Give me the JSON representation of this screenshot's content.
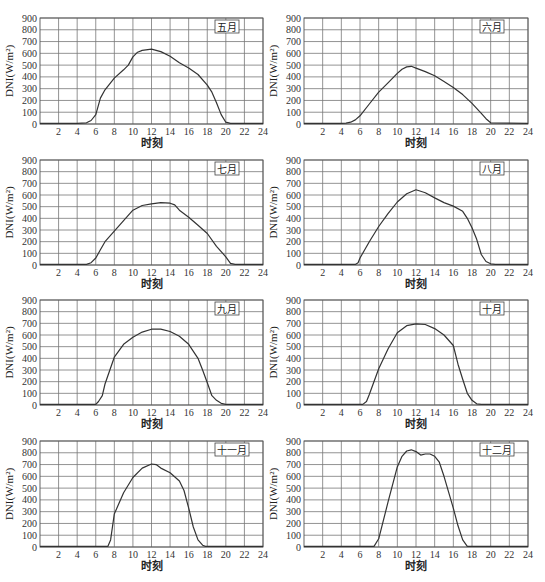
{
  "chart_data": [
    {
      "type": "line",
      "title": "五月",
      "xlabel": "时刻",
      "ylabel": "DNI(W/m²)",
      "xlim": [
        0,
        24
      ],
      "ylim": [
        0,
        900
      ],
      "xticks": [
        2,
        4,
        6,
        8,
        10,
        12,
        14,
        16,
        18,
        20,
        22,
        24
      ],
      "yticks": [
        0,
        100,
        200,
        300,
        400,
        500,
        600,
        700,
        800,
        900
      ],
      "grid": true,
      "x": [
        0,
        4,
        5,
        5.5,
        6,
        6.5,
        7,
        8,
        9,
        9.5,
        10,
        10.5,
        11,
        12,
        13,
        14,
        15,
        16,
        17,
        18,
        18.5,
        19,
        19.5,
        20,
        20.5,
        24
      ],
      "values": [
        5,
        5,
        10,
        30,
        80,
        220,
        290,
        390,
        460,
        500,
        570,
        610,
        625,
        635,
        615,
        575,
        520,
        475,
        420,
        330,
        270,
        180,
        80,
        15,
        5,
        5
      ]
    },
    {
      "type": "line",
      "title": "六月",
      "xlabel": "时刻",
      "ylabel": "DNI(W/m²)",
      "xlim": [
        0,
        24
      ],
      "ylim": [
        0,
        900
      ],
      "xticks": [
        2,
        4,
        6,
        8,
        10,
        12,
        14,
        16,
        18,
        20,
        22,
        24
      ],
      "yticks": [
        0,
        100,
        200,
        300,
        400,
        500,
        600,
        700,
        800,
        900
      ],
      "grid": true,
      "x": [
        0,
        4,
        4.5,
        5,
        5.5,
        6,
        7,
        8,
        9,
        10,
        10.5,
        11,
        11.5,
        12,
        13,
        14,
        15,
        16,
        17,
        18,
        19,
        19.5,
        20,
        24
      ],
      "values": [
        5,
        5,
        8,
        15,
        35,
        70,
        170,
        270,
        350,
        430,
        465,
        485,
        490,
        475,
        445,
        410,
        360,
        310,
        250,
        175,
        90,
        45,
        10,
        5
      ]
    },
    {
      "type": "line",
      "title": "七月",
      "xlabel": "时刻",
      "ylabel": "DNI(W/m²)",
      "xlim": [
        0,
        24
      ],
      "ylim": [
        0,
        900
      ],
      "xticks": [
        2,
        4,
        6,
        8,
        10,
        12,
        14,
        16,
        18,
        20,
        22,
        24
      ],
      "yticks": [
        0,
        100,
        200,
        300,
        400,
        500,
        600,
        700,
        800,
        900
      ],
      "grid": true,
      "x": [
        0,
        5,
        5.5,
        6,
        6.5,
        7,
        8,
        9,
        10,
        11,
        12,
        13,
        14,
        14.5,
        15,
        16,
        17,
        18,
        19,
        20,
        20.5,
        21,
        24
      ],
      "values": [
        5,
        5,
        20,
        60,
        130,
        200,
        290,
        380,
        470,
        510,
        525,
        535,
        530,
        515,
        470,
        410,
        340,
        270,
        160,
        70,
        15,
        5,
        5
      ]
    },
    {
      "type": "line",
      "title": "八月",
      "xlabel": "时刻",
      "ylabel": "DNI(W/m²)",
      "xlim": [
        0,
        24
      ],
      "ylim": [
        0,
        900
      ],
      "xticks": [
        2,
        4,
        6,
        8,
        10,
        12,
        14,
        16,
        18,
        20,
        22,
        24
      ],
      "yticks": [
        0,
        100,
        200,
        300,
        400,
        500,
        600,
        700,
        800,
        900
      ],
      "grid": true,
      "x": [
        0,
        5.5,
        5.8,
        6,
        7,
        8,
        9,
        10,
        11,
        12,
        13,
        14,
        15,
        16,
        17,
        17.5,
        18,
        18.5,
        19,
        19.5,
        20,
        20.5,
        24
      ],
      "values": [
        5,
        5,
        20,
        60,
        200,
        330,
        440,
        540,
        610,
        645,
        620,
        575,
        535,
        505,
        460,
        400,
        320,
        220,
        90,
        30,
        10,
        5,
        5
      ]
    },
    {
      "type": "line",
      "title": "九月",
      "xlabel": "时刻",
      "ylabel": "DNI(W/m²)",
      "xlim": [
        0,
        24
      ],
      "ylim": [
        0,
        900
      ],
      "xticks": [
        2,
        4,
        6,
        8,
        10,
        12,
        14,
        16,
        18,
        20,
        22,
        24
      ],
      "yticks": [
        0,
        100,
        200,
        300,
        400,
        500,
        600,
        700,
        800,
        900
      ],
      "grid": true,
      "x": [
        0,
        6,
        6.3,
        6.7,
        7,
        8,
        9,
        10,
        11,
        12,
        13,
        14,
        15,
        16,
        17,
        17.5,
        18,
        18.5,
        19,
        19.5,
        20,
        24
      ],
      "values": [
        5,
        5,
        30,
        80,
        180,
        410,
        520,
        580,
        625,
        650,
        650,
        630,
        590,
        520,
        400,
        300,
        190,
        80,
        40,
        15,
        5,
        5
      ]
    },
    {
      "type": "line",
      "title": "十月",
      "xlabel": "时刻",
      "ylabel": "DNI(W/m²)",
      "xlim": [
        0,
        24
      ],
      "ylim": [
        0,
        900
      ],
      "xticks": [
        2,
        4,
        6,
        8,
        10,
        12,
        14,
        16,
        18,
        20,
        22,
        24
      ],
      "yticks": [
        0,
        100,
        200,
        300,
        400,
        500,
        600,
        700,
        800,
        900
      ],
      "grid": true,
      "x": [
        0,
        6.3,
        6.7,
        7,
        8,
        9,
        10,
        11,
        12,
        13,
        14,
        15,
        16,
        16.5,
        17,
        17.5,
        18,
        18.5,
        19,
        24
      ],
      "values": [
        5,
        5,
        30,
        90,
        310,
        480,
        620,
        680,
        695,
        690,
        655,
        600,
        510,
        350,
        220,
        100,
        40,
        10,
        5,
        5
      ]
    },
    {
      "type": "line",
      "title": "十一月",
      "xlabel": "时刻",
      "ylabel": "DNI(W/m²)",
      "xlim": [
        0,
        24
      ],
      "ylim": [
        0,
        900
      ],
      "xticks": [
        2,
        4,
        6,
        8,
        10,
        12,
        14,
        16,
        18,
        20,
        22,
        24
      ],
      "yticks": [
        0,
        100,
        200,
        300,
        400,
        500,
        600,
        700,
        800,
        900
      ],
      "grid": true,
      "x": [
        0,
        7.3,
        7.6,
        8,
        9,
        10,
        11,
        12,
        12.5,
        13,
        14,
        15,
        15.5,
        16,
        16.5,
        17,
        17.5,
        17.8,
        24
      ],
      "values": [
        5,
        5,
        60,
        280,
        460,
        590,
        670,
        705,
        700,
        670,
        630,
        560,
        480,
        330,
        170,
        60,
        15,
        5,
        5
      ]
    },
    {
      "type": "line",
      "title": "十二月",
      "xlabel": "时刻",
      "ylabel": "DNI(W/m²)",
      "xlim": [
        0,
        24
      ],
      "ylim": [
        0,
        900
      ],
      "xticks": [
        2,
        4,
        6,
        8,
        10,
        12,
        14,
        16,
        18,
        20,
        22,
        24
      ],
      "yticks": [
        0,
        100,
        200,
        300,
        400,
        500,
        600,
        700,
        800,
        900
      ],
      "grid": true,
      "x": [
        0,
        7.5,
        8,
        9,
        10,
        10.5,
        11,
        11.5,
        12,
        12.5,
        13,
        13.5,
        14,
        14.5,
        15,
        16,
        16.5,
        17,
        17.5,
        24
      ],
      "values": [
        5,
        5,
        70,
        380,
        680,
        770,
        815,
        825,
        810,
        780,
        790,
        790,
        770,
        720,
        600,
        330,
        180,
        60,
        5,
        5
      ]
    }
  ],
  "panels": [
    {
      "month": "五月"
    },
    {
      "month": "六月"
    },
    {
      "month": "七月"
    },
    {
      "month": "八月"
    },
    {
      "month": "九月"
    },
    {
      "month": "十月"
    },
    {
      "month": "十一月"
    },
    {
      "month": "十二月"
    }
  ],
  "axis": {
    "xlabel": "时刻",
    "ylabel": "DNI(W/m²)"
  }
}
